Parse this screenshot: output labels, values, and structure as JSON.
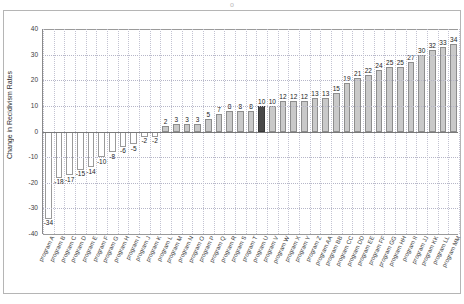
{
  "title_partial": "o",
  "chart_data": {
    "type": "bar",
    "title": "",
    "xlabel": "",
    "ylabel": "Change in Recidivism Rates",
    "ylim": [
      -40,
      40
    ],
    "yticks": [
      40,
      30,
      20,
      10,
      0,
      -10,
      -20,
      -30,
      -40
    ],
    "grid": true,
    "legend": "none",
    "highlight_index": 20,
    "highlight_color": "#4a4a4a",
    "bar_color": "#c9c9c9",
    "negative_bar_color": "#ffffff",
    "categories": [
      "program A",
      "program B",
      "program C",
      "program D",
      "program E",
      "program F",
      "program G",
      "program H",
      "program I",
      "program J",
      "program K",
      "program L",
      "program M",
      "program N",
      "program O",
      "program P",
      "program Q",
      "program R",
      "program S",
      "program T",
      "program U",
      "program V",
      "program W",
      "program X",
      "program Y",
      "program Z",
      "program AA",
      "program BB",
      "program CC",
      "program DD",
      "program EE",
      "program FF",
      "program GG",
      "program HH",
      "program II",
      "program JJ",
      "program KK",
      "program LL",
      "program MM"
    ],
    "values": [
      -34,
      -18,
      -17,
      -15,
      -14,
      -10,
      -8,
      -6,
      -5,
      -2,
      -2,
      2,
      3,
      3,
      3,
      5,
      7,
      8,
      8,
      8,
      10,
      10,
      12,
      12,
      12,
      13,
      13,
      15,
      19,
      21,
      22,
      24,
      25,
      25,
      27,
      30,
      32,
      33,
      34
    ]
  }
}
